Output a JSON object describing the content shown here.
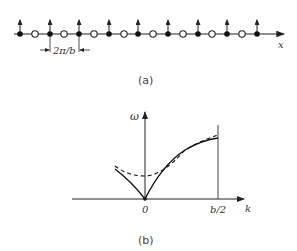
{
  "panel_a": {
    "caption": "(a)",
    "axis_label": "x",
    "spacing_label": "2π/b",
    "filled_sites_x": [
      20,
      50,
      79,
      109,
      138,
      168,
      198,
      227,
      257
    ],
    "open_sites_x": [
      35,
      64,
      94,
      124,
      153,
      183,
      212,
      242
    ]
  },
  "panel_b": {
    "caption": "(b)",
    "y_label": "ω",
    "x_label": "k",
    "x_ticks": [
      "0",
      "b/2"
    ]
  },
  "chart_data": {
    "type": "line",
    "title": "",
    "xlabel": "k",
    "ylabel": "ω",
    "x_ticks": [
      "0",
      "b/2"
    ],
    "series": [
      {
        "name": "solid (gapless)",
        "style": "solid",
        "x": [
          -0.4,
          0,
          0.25,
          0.5,
          0.75,
          1.0
        ],
        "y": [
          0.41,
          0,
          0.35,
          0.58,
          0.73,
          0.82
        ]
      },
      {
        "name": "dashed (gapped)",
        "style": "dashed",
        "x": [
          -0.4,
          0,
          0.25,
          0.5,
          0.75,
          1.0
        ],
        "y": [
          0.45,
          0.31,
          0.45,
          0.62,
          0.75,
          0.85
        ]
      }
    ],
    "xlim": [
      -1,
      1.3
    ],
    "grid": false
  }
}
